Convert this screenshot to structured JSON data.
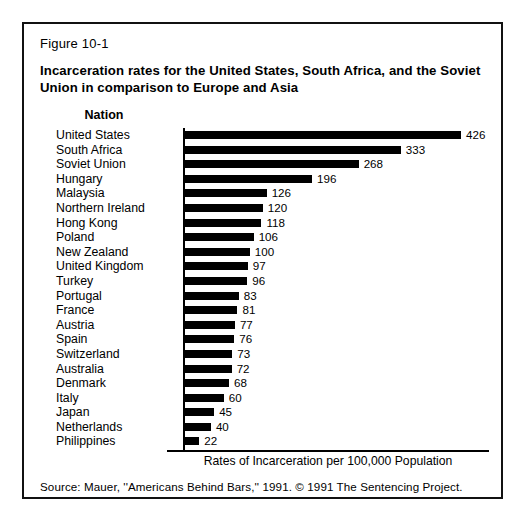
{
  "figure": {
    "number": "Figure 10-1",
    "title": "Incarceration rates for the United States, South Africa, and the Soviet Union in comparison to Europe and Asia",
    "column_header": "Nation",
    "source": "Source: Mauer, ''Americans Behind Bars,'' 1991. © 1991 The Sentencing Project."
  },
  "colors": {
    "bar": "#000000",
    "frame": "#111111",
    "background": "#ffffff",
    "text": "#000000"
  },
  "chart_data": {
    "type": "bar",
    "orientation": "horizontal",
    "title": "Incarceration rates for the United States, South Africa, and the Soviet Union in comparison to Europe and Asia",
    "subtitle": "Figure 10-1",
    "xlabel": "Rates of Incarceration per 100,000 Population",
    "ylabel": "Nation",
    "xlim": [
      0,
      426
    ],
    "grid": false,
    "legend": false,
    "value_labels": true,
    "categories": [
      "United States",
      "South Africa",
      "Soviet Union",
      "Hungary",
      "Malaysia",
      "Northern Ireland",
      "Hong Kong",
      "Poland",
      "New Zealand",
      "United Kingdom",
      "Turkey",
      "Portugal",
      "France",
      "Austria",
      "Spain",
      "Switzerland",
      "Australia",
      "Denmark",
      "Italy",
      "Japan",
      "Netherlands",
      "Philippines"
    ],
    "values": [
      426,
      333,
      268,
      196,
      126,
      120,
      118,
      106,
      100,
      97,
      96,
      83,
      81,
      77,
      76,
      73,
      72,
      68,
      60,
      45,
      40,
      22
    ]
  }
}
